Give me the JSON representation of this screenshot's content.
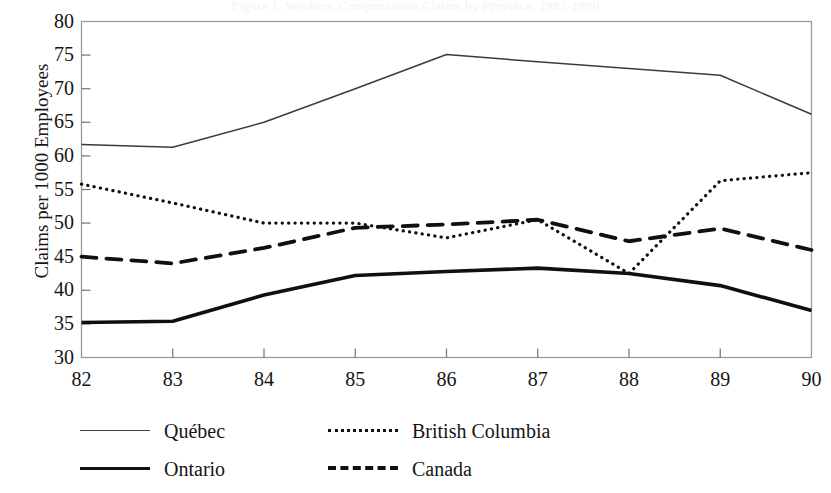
{
  "figure": {
    "faint_header": "Figure 1. Workers' Compensation Claims by Province, 1982-1990"
  },
  "chart_data": {
    "type": "line",
    "title": "",
    "xlabel": "",
    "ylabel": "Claims per 1000 Employees",
    "categories": [
      "82",
      "83",
      "84",
      "85",
      "86",
      "87",
      "88",
      "89",
      "90"
    ],
    "x_tick_labels": [
      "82",
      "83",
      "84",
      "85",
      "86",
      "87",
      "88",
      "89",
      "90"
    ],
    "y_tick_labels": [
      "30",
      "35",
      "40",
      "45",
      "50",
      "55",
      "60",
      "65",
      "70",
      "75",
      "80"
    ],
    "y_ticks": [
      30,
      35,
      40,
      45,
      50,
      55,
      60,
      65,
      70,
      75,
      80
    ],
    "ylim": [
      30,
      80
    ],
    "xlim": [
      82,
      90
    ],
    "grid": false,
    "legend_position": "below-left",
    "series": [
      {
        "name": "Québec",
        "style": "solid-thin",
        "color": "#3b3b3b",
        "values": [
          61.7,
          61.3,
          65.0,
          70.0,
          75.1,
          74.0,
          73.0,
          72.0,
          66.2
        ]
      },
      {
        "name": "Ontario",
        "style": "solid-thick",
        "color": "#101010",
        "values": [
          35.2,
          35.4,
          39.3,
          42.2,
          42.8,
          43.3,
          42.5,
          40.7,
          37.0
        ]
      },
      {
        "name": "British Columbia",
        "style": "dotted",
        "color": "#101010",
        "values": [
          55.8,
          53.0,
          50.0,
          50.0,
          47.8,
          50.5,
          42.5,
          56.3,
          57.5
        ]
      },
      {
        "name": "Canada",
        "style": "dashed",
        "color": "#101010",
        "values": [
          45.0,
          44.0,
          46.3,
          49.3,
          49.8,
          50.5,
          47.3,
          49.2,
          46.0
        ]
      }
    ]
  },
  "legend": {
    "entries": [
      {
        "label": "Québec",
        "style": "solid-thin"
      },
      {
        "label": "Ontario",
        "style": "solid-thick"
      },
      {
        "label": "British Columbia",
        "style": "dotted"
      },
      {
        "label": "Canada",
        "style": "dashed"
      }
    ]
  }
}
